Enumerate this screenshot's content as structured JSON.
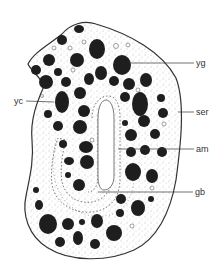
{
  "figure": {
    "type": "biological cross-section illustration",
    "labels": [
      {
        "id": "yg",
        "text": "yg",
        "x": 196,
        "y": 60
      },
      {
        "id": "yc",
        "text": "yc",
        "x": 14,
        "y": 98
      },
      {
        "id": "ser",
        "text": "ser",
        "x": 196,
        "y": 108
      },
      {
        "id": "am",
        "text": "am",
        "x": 196,
        "y": 145
      },
      {
        "id": "gb",
        "text": "gb",
        "x": 195,
        "y": 192
      }
    ],
    "colors": {
      "outline": "#333333",
      "granule": "#1e1e1e",
      "background": "#ffffff",
      "stipple": "#888888"
    }
  }
}
